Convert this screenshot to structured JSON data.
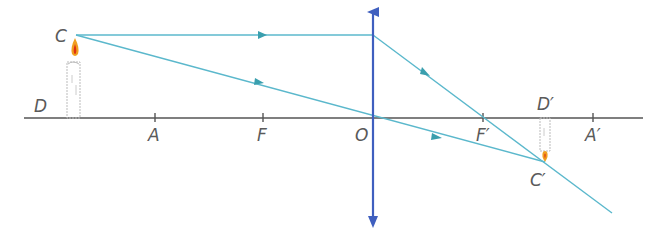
{
  "diagram": {
    "type": "converging-lens-ray-diagram",
    "colors": {
      "axis": "#555555",
      "lens": "#3f5fbf",
      "ray": "#5bb8cc",
      "ray_arrow": "#3a9fae",
      "flame_outer": "#f0a020",
      "flame_inner": "#e03010",
      "candle_outline": "#bbbbbb"
    },
    "labels": {
      "C": "C",
      "D": "D",
      "A": "A",
      "F": "F",
      "O": "O",
      "F_prime": "F′",
      "A_prime": "A′",
      "D_prime": "D′",
      "C_prime": "C′"
    },
    "elements": {
      "optical_axis": "principal axis",
      "lens": "converging lens",
      "object": "candle (upright)",
      "image": "candle (inverted, real)",
      "rays": [
        "parallel ray refracted through F′",
        "ray through optical centre O"
      ]
    }
  }
}
